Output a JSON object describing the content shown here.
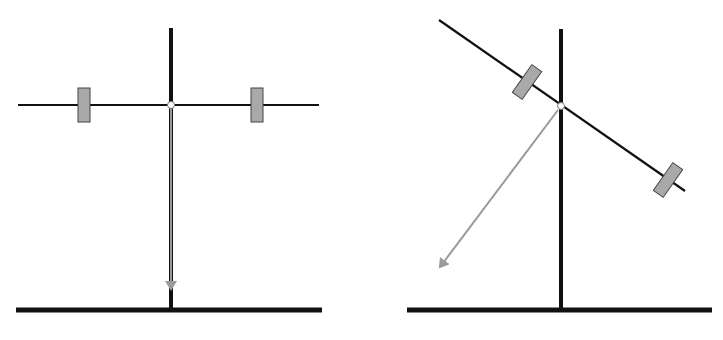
{
  "diagram": {
    "type": "balance-beam-comparison",
    "colors": {
      "background": "#ffffff",
      "structure": "#111111",
      "weight_fill": "#a9a9a9",
      "weight_stroke": "#444444",
      "force_arrow": "#9a9a9a",
      "pivot_fill": "#ffffff"
    },
    "panels": [
      {
        "name": "balanced",
        "pole": {
          "x": 171,
          "y1": 28,
          "y2": 310
        },
        "ground": {
          "x1": 16,
          "x2": 322,
          "y": 310
        },
        "beam": {
          "x1": 18,
          "y1": 105,
          "x2": 319,
          "y2": 105
        },
        "pivot": {
          "cx": 171,
          "cy": 105,
          "r": 3.5
        },
        "weights": [
          {
            "cx": 84,
            "cy": 105,
            "w": 12,
            "h": 34,
            "angle": 0
          },
          {
            "cx": 257,
            "cy": 105,
            "w": 12,
            "h": 34,
            "angle": 0
          }
        ],
        "arrow": {
          "x1": 171,
          "y1": 109,
          "x2": 171,
          "y2": 289
        }
      },
      {
        "name": "tilted",
        "pole": {
          "x": 561,
          "y1": 29,
          "y2": 310
        },
        "ground": {
          "x1": 407,
          "x2": 712,
          "y": 310
        },
        "beam": {
          "x1": 439,
          "y1": 20,
          "x2": 685,
          "y2": 191
        },
        "pivot": {
          "cx": 561,
          "cy": 106,
          "r": 3.5
        },
        "weights": [
          {
            "cx": 527,
            "cy": 82,
            "w": 12,
            "h": 34,
            "angle": 35
          },
          {
            "cx": 668,
            "cy": 180,
            "w": 12,
            "h": 34,
            "angle": 35
          }
        ],
        "arrow": {
          "x1": 558,
          "y1": 110,
          "x2": 440,
          "y2": 267
        }
      }
    ]
  }
}
